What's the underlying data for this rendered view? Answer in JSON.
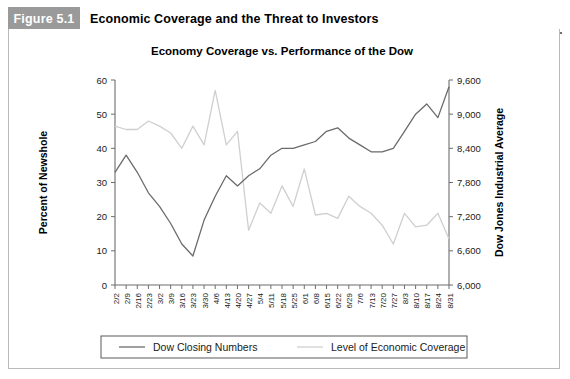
{
  "figure": {
    "tag": "Figure 5.1",
    "title": "Economic Coverage and the Threat to Investors"
  },
  "chart_data": {
    "type": "line",
    "title": "Economy Coverage vs. Performance of the Dow",
    "xlabel": "Date",
    "ylabel": "Percent of Newshole",
    "y2label": "Dow Jones Industrial Average",
    "ylim": [
      0,
      60
    ],
    "y2lim": [
      6000,
      9600
    ],
    "yticks": [
      "0",
      "10",
      "20",
      "30",
      "40",
      "50",
      "60"
    ],
    "y2ticks": [
      "6,000",
      "6,600",
      "7,200",
      "7,800",
      "8,400",
      "9,000",
      "9,600"
    ],
    "grid": false,
    "legend_position": "bottom",
    "categories": [
      "2/2",
      "2/9",
      "2/16",
      "2/23",
      "3/2",
      "3/9",
      "3/16",
      "3/23",
      "3/30",
      "4/6",
      "4/13",
      "4/20",
      "4/27",
      "5/4",
      "5/11",
      "5/18",
      "5/25",
      "6/1",
      "6/8",
      "6/15",
      "6/22",
      "6/29",
      "7/6",
      "7/13",
      "7/20",
      "7/27",
      "8/3",
      "8/10",
      "8/17",
      "8/24",
      "8/31"
    ],
    "series": [
      {
        "name": "Dow Closing Numbers",
        "axis": "right",
        "color": "#6b6b6b",
        "values": [
          7980,
          8280,
          7980,
          7620,
          7380,
          7080,
          6720,
          6510,
          7140,
          7560,
          7920,
          7740,
          7920,
          8040,
          8280,
          8400,
          8400,
          8460,
          8520,
          8700,
          8760,
          8580,
          8460,
          8340,
          8340,
          8400,
          8700,
          9000,
          9180,
          8940,
          9480
        ],
        "percent_scale_values": [
          33.0,
          38.0,
          33.0,
          27.0,
          23.0,
          18.0,
          12.0,
          8.5,
          19.0,
          26.0,
          32.0,
          29.0,
          32.0,
          34.0,
          38.0,
          40.0,
          40.0,
          41.0,
          42.0,
          45.0,
          46.0,
          43.0,
          41.0,
          39.0,
          39.0,
          40.0,
          45.0,
          50.0,
          53.0,
          49.0,
          58.0
        ]
      },
      {
        "name": "Level of Economic Coverage",
        "axis": "left",
        "color": "#cfcfcf",
        "values": [
          46.5,
          45.5,
          45.5,
          48.0,
          46.5,
          44.5,
          40.0,
          46.5,
          41.0,
          57.0,
          41.0,
          45.0,
          16.0,
          24.0,
          21.0,
          29.0,
          23.0,
          34.0,
          20.5,
          21.0,
          19.5,
          26.0,
          23.0,
          21.0,
          17.5,
          12.0,
          21.0,
          17.0,
          17.5,
          21.0,
          13.5
        ]
      }
    ],
    "legend": [
      "Dow Closing Numbers",
      "Level of Economic Coverage"
    ]
  }
}
